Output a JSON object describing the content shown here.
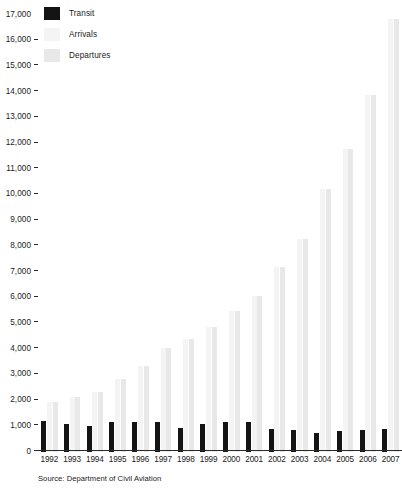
{
  "source_note": "Source: Department of Civil Aviation",
  "legend": {
    "items": [
      {
        "label": "Transit",
        "color": "#141414",
        "key": "transit"
      },
      {
        "label": "Arrivals",
        "color": "#f4f4f4",
        "key": "arrivals"
      },
      {
        "label": "Departures",
        "color": "#e8e8e8",
        "key": "departures"
      }
    ]
  },
  "chart_data": {
    "type": "bar",
    "title": "",
    "subtitle": "",
    "xlabel": "",
    "ylabel": "",
    "grid": false,
    "legend_position": "top-left",
    "ylim": [
      0,
      17000
    ],
    "ytick_labels": [
      "17,000",
      "16,000",
      "15,000",
      "14,000",
      "13,000",
      "12,000",
      "11,000",
      "10,000",
      "9,000",
      "8,000",
      "7,000",
      "6,000",
      "5,000",
      "4,000",
      "3,000",
      "2,000",
      "1,000",
      "0"
    ],
    "ytick_values": [
      17000,
      16000,
      15000,
      14000,
      13000,
      12000,
      11000,
      10000,
      9000,
      8000,
      7000,
      6000,
      5000,
      4000,
      3000,
      2000,
      1000,
      0
    ],
    "categories": [
      "1992",
      "1993",
      "1994",
      "1995",
      "1996",
      "1997",
      "1998",
      "1999",
      "2000",
      "2001",
      "2002",
      "2003",
      "2004",
      "2005",
      "2006",
      "2007"
    ],
    "series": [
      {
        "name": "Transit",
        "color": "#141414",
        "values": [
          1200,
          1100,
          1000,
          1150,
          1150,
          1150,
          950,
          1100,
          1150,
          1150,
          900,
          850,
          750,
          800,
          850,
          900
        ]
      },
      {
        "name": "Arrivals",
        "color": "#f4f4f4",
        "values": [
          1950,
          2150,
          2350,
          2850,
          3350,
          4050,
          4400,
          4850,
          5500,
          6050,
          7200,
          8300,
          10250,
          11800,
          13900,
          16850
        ]
      },
      {
        "name": "Departures",
        "color": "#e8e8e8",
        "values": [
          1950,
          2150,
          2350,
          2850,
          3350,
          4050,
          4400,
          4850,
          5500,
          6050,
          7200,
          8300,
          10250,
          11800,
          13900,
          16850
        ]
      }
    ]
  }
}
